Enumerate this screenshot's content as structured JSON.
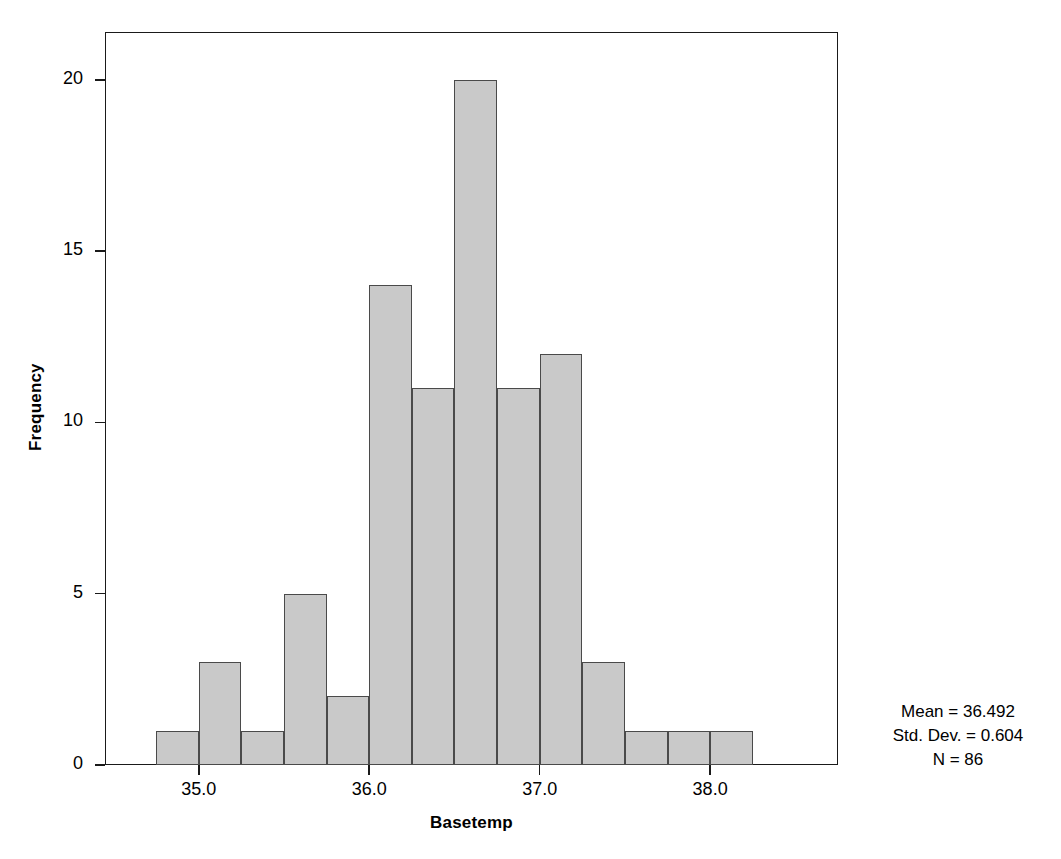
{
  "chart_data": {
    "type": "bar",
    "title": "",
    "subtitle": "",
    "xlabel": "Basetemp",
    "ylabel": "Frequency",
    "xlim": [
      34.45,
      38.75
    ],
    "ylim": [
      0,
      21.4
    ],
    "grid": false,
    "legend": null,
    "bin_width": 0.25,
    "bin_starts": [
      34.75,
      35.0,
      35.25,
      35.5,
      35.75,
      36.0,
      36.25,
      36.5,
      36.75,
      37.0,
      37.25,
      37.5,
      37.75,
      38.0
    ],
    "categories": [
      "34.75-35.00",
      "35.00-35.25",
      "35.25-35.50",
      "35.50-35.75",
      "35.75-36.00",
      "36.00-36.25",
      "36.25-36.50",
      "36.50-36.75",
      "36.75-37.00",
      "37.00-37.25",
      "37.25-37.50",
      "37.50-37.75",
      "37.75-38.00",
      "38.00-38.25"
    ],
    "values": [
      1,
      3,
      1,
      5,
      2,
      14,
      11,
      20,
      11,
      12,
      3,
      1,
      1,
      1
    ],
    "xticks": [
      35.0,
      36.0,
      37.0,
      38.0
    ],
    "xtick_labels": [
      "35.0",
      "36.0",
      "37.0",
      "38.0"
    ],
    "yticks": [
      0,
      5,
      10,
      15,
      20
    ],
    "ytick_labels": [
      "0",
      "5",
      "10",
      "15",
      "20"
    ],
    "annotations": {
      "mean": "Mean = 36.492",
      "std_dev": "Std. Dev. = 0.604",
      "n": "N = 86"
    },
    "colors": {
      "bar_fill": "#c9c9c9",
      "bar_edge": "#4a4a4a",
      "axis": "#1a1a1a",
      "text": "#000000",
      "background": "#ffffff"
    }
  }
}
